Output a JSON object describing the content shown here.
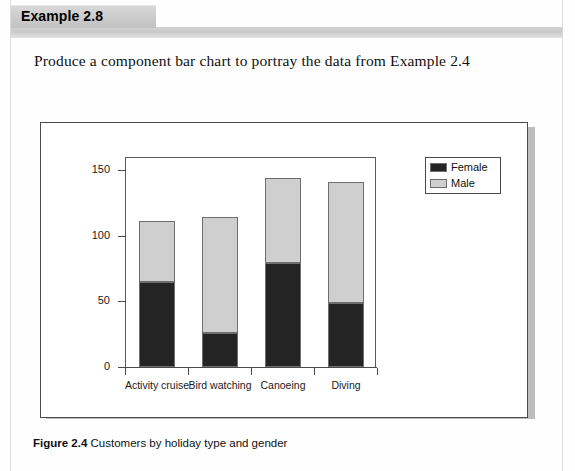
{
  "header": {
    "tab_label": "Example 2.8"
  },
  "prompt": {
    "text": "Produce a component bar chart to portray the data from Example 2.4"
  },
  "caption": {
    "figure_number": "Figure 2.4",
    "figure_title": "Customers by holiday type and gender"
  },
  "colors": {
    "female": "#242424",
    "male": "#cfcfcf",
    "axis": "#4a4a4a",
    "panel_border": "#4a4a4a",
    "header_tab": "#cfcfcf",
    "page": "#ffffff"
  },
  "chart_data": {
    "type": "bar",
    "stacked": true,
    "title": "",
    "xlabel": "",
    "ylabel": "",
    "ylim": [
      0,
      160
    ],
    "yticks": [
      0,
      50,
      100,
      150
    ],
    "ytick_labels": [
      "0",
      "50",
      "100",
      "150"
    ],
    "grid": false,
    "legend_position": "top-right-outside",
    "categories": [
      "Activity cruise",
      "Bird watching",
      "Canoeing",
      "Diving"
    ],
    "series": [
      {
        "name": "Female",
        "color": "#242424",
        "values": [
          65,
          26,
          79,
          49
        ]
      },
      {
        "name": "Male",
        "color": "#cfcfcf",
        "values": [
          46,
          88,
          65,
          92
        ]
      }
    ],
    "totals": [
      111,
      114,
      144,
      141
    ]
  }
}
